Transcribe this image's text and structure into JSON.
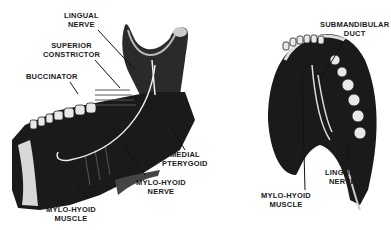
{
  "figure": {
    "left_view": {
      "labels": {
        "lingual_nerve": [
          "LINGUAL",
          "NERVE"
        ],
        "superior_constrictor": [
          "SUPERIOR",
          "CONSTRICTOR"
        ],
        "buccinator": [
          "BUCCINATOR"
        ],
        "medial_pterygoid": [
          "MEDIAL",
          "PTERYGOID"
        ],
        "mylo_hyoid_nerve": [
          "MYLO-HYOID",
          "NERVE"
        ],
        "mylo_hyoid_muscle": [
          "MYLO-HYOID",
          "MUSCLE"
        ]
      }
    },
    "right_view": {
      "labels": {
        "submandibular_duct": [
          "SUBMANDIBULAR",
          "DUCT"
        ],
        "mylo_hyoid_muscle": [
          "MYLO-HYOID",
          "MUSCLE"
        ],
        "lingual_nerve": [
          "LINGUAL",
          "NERVE"
        ]
      }
    }
  }
}
